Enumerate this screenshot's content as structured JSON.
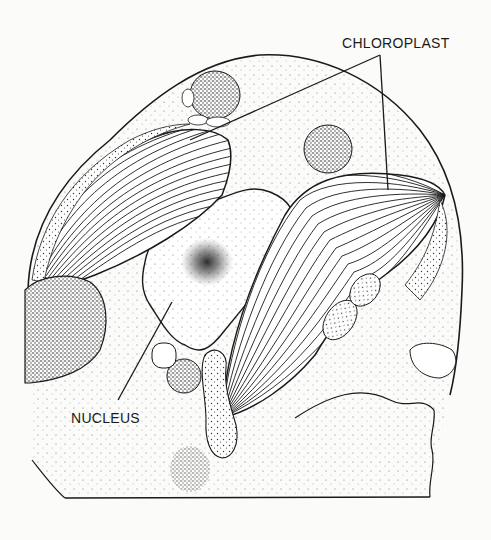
{
  "diagram": {
    "type": "biological-cell-illustration",
    "style": "black ink stipple drawing on white",
    "colors": {
      "ink": "#1a1a1a",
      "background": "#fbfbf9"
    },
    "labels": {
      "chloroplast": "CHLOROPLAST",
      "nucleus": "NUCLEUS"
    },
    "structures": [
      {
        "name": "chloroplast",
        "count": 2,
        "description": "two lamellar (striated) chloroplasts"
      },
      {
        "name": "nucleus",
        "count": 1,
        "description": "central pale body with dense stippled nucleolus"
      },
      {
        "name": "dense-body",
        "count": 4,
        "description": "round heavily stippled granules"
      },
      {
        "name": "cell-wall",
        "count": 1,
        "description": "outer curved boundary"
      }
    ],
    "leader_lines": [
      {
        "label": "chloroplast",
        "targets": 2
      },
      {
        "label": "nucleus",
        "targets": 1
      }
    ]
  }
}
